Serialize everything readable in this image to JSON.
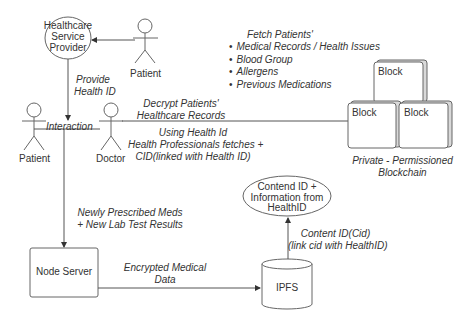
{
  "actors": {
    "hsp": "Healthcare Service Provider",
    "hsp_lines": [
      "Healthcare",
      "Service",
      "Provider"
    ],
    "patient_top": "Patient",
    "patient_left": "Patient",
    "doctor": "Doctor"
  },
  "edges": {
    "provide_health_id": [
      "Provide",
      "Health ID"
    ],
    "interaction": "Interaction",
    "decrypt": [
      "Decrypt Patients'",
      "Healthcare Records"
    ],
    "using_health_id": [
      "Using Health Id",
      "Health Professionals fetches +",
      "CID(linked with Health ID)"
    ],
    "newly_prescribed": [
      "Newly Prescribed Meds",
      "+ New Lab Test Results"
    ],
    "encrypted": [
      "Encrypted Medical",
      "Data"
    ],
    "content_id": [
      "Content ID(Cid)",
      "(link cid with HealthID)"
    ]
  },
  "fetch": {
    "title": "Fetch Patients'",
    "items": [
      "Medical Records / Health Issues",
      "Blood Group",
      "Allergens",
      "Previous Medications"
    ]
  },
  "blockchain": {
    "blocks": [
      "Block",
      "Block",
      "Block"
    ],
    "caption": [
      "Private - Permissioned",
      "Blockchain"
    ]
  },
  "nodes": {
    "node_server": "Node Server",
    "ipfs": "IPFS",
    "content_ellipse": [
      "Contend ID +",
      "Information from",
      "HealthID"
    ]
  },
  "colors": {
    "line": "#555555",
    "block_face": "#ffffff",
    "block_side": "#d9d9d9"
  }
}
